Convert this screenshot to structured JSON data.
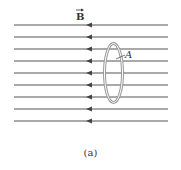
{
  "figure": {
    "field_label": "B",
    "field_vector_symbol": "→",
    "loop_label": "A",
    "caption": "(a)",
    "field_direction": "left",
    "line_count": 9,
    "line_color": "#555555",
    "loop_color": "#888888"
  }
}
